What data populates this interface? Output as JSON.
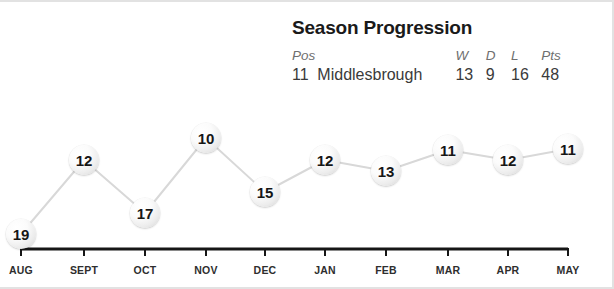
{
  "header": {
    "title": "Season Progression",
    "columns": [
      "Pos",
      "",
      "W",
      "D",
      "L",
      "Pts"
    ],
    "col_pos": "Pos",
    "col_team": "",
    "col_w": "W",
    "col_d": "D",
    "col_l": "L",
    "col_pts": "Pts",
    "position": "11",
    "team": "Middlesbrough",
    "wins": "13",
    "draws": "9",
    "losses": "16",
    "points": "48"
  },
  "colors": {
    "title": "#1a1a1a",
    "header_text": "#6f6f6f",
    "value_text": "#3a3a3a",
    "line": "#d8d8d8",
    "axis": "#161616",
    "marker_fill": "#f2f2f2",
    "marker_text": "#161616",
    "frame": "#e2e2e2"
  },
  "chart_data": {
    "type": "line",
    "title": "Season Progression",
    "xlabel": "",
    "ylabel": "League Position",
    "categories": [
      "AUG",
      "SEPT",
      "OCT",
      "NOV",
      "DEC",
      "JAN",
      "FEB",
      "MAR",
      "APR",
      "MAY"
    ],
    "values": [
      19,
      12,
      17,
      10,
      15,
      12,
      13,
      11,
      12,
      11
    ],
    "data_labels": [
      "19",
      "12",
      "17",
      "10",
      "15",
      "12",
      "13",
      "11",
      "12",
      "11"
    ],
    "ylim": [
      20,
      9
    ],
    "y_inverted": true,
    "grid": false,
    "legend": null,
    "points": [
      {
        "category": "AUG",
        "value": 19,
        "label": "19",
        "x": 21,
        "y": 232
      },
      {
        "category": "SEPT",
        "value": 12,
        "label": "12",
        "x": 84,
        "y": 158
      },
      {
        "category": "OCT",
        "value": 17,
        "label": "17",
        "x": 145,
        "y": 211
      },
      {
        "category": "NOV",
        "value": 10,
        "label": "10",
        "x": 206,
        "y": 136
      },
      {
        "category": "DEC",
        "value": 15,
        "label": "15",
        "x": 265,
        "y": 190
      },
      {
        "category": "JAN",
        "value": 12,
        "label": "12",
        "x": 325,
        "y": 158
      },
      {
        "category": "FEB",
        "value": 13,
        "label": "13",
        "x": 386,
        "y": 169
      },
      {
        "category": "MAR",
        "value": 11,
        "label": "11",
        "x": 448,
        "y": 148
      },
      {
        "category": "APR",
        "value": 12,
        "label": "12",
        "x": 508,
        "y": 158
      },
      {
        "category": "MAY",
        "value": 11,
        "label": "11",
        "x": 568,
        "y": 147
      }
    ],
    "axis": {
      "y": 247,
      "x_start": 21,
      "x_end": 568,
      "tick_height": 7
    }
  }
}
